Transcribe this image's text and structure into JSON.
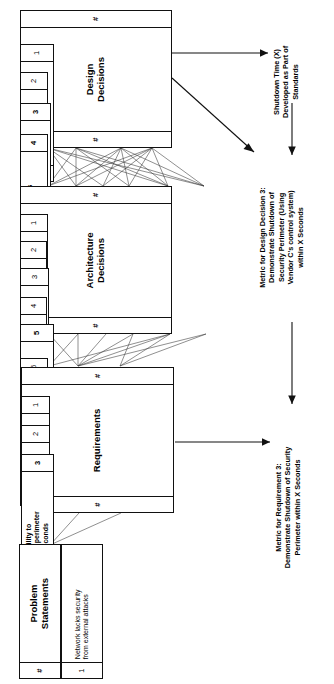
{
  "diagram": {
    "orientation": "rotated-90-ccw"
  },
  "tables": {
    "design_decisions": {
      "title": "Design\nDecisions",
      "num_header": "#",
      "rows": [
        {
          "num": "1",
          "text": "Vendor A IDS (Type,\nOS, Config) selected",
          "bold": false
        },
        {
          "num": "2",
          "text": "Vendor B routers\n(Type, OS, Config)\nSelected",
          "bold": false
        },
        {
          "num": "3",
          "text": "Vendor C's perimeter\ncontrol system\nselected",
          "bold": true
        },
        {
          "num": "4",
          "text": "Perimeter standards\n(List) selected",
          "bold": true
        }
      ]
    },
    "architecture_decisions": {
      "title": "Architecture\nDecisions",
      "num_header": "#",
      "rows": [
        {
          "num": "1",
          "text": "Collapse all external\nconnections to two\nlocations",
          "bold": false
        },
        {
          "num": "2",
          "text": "Provide DMZs to external\nnetworks",
          "bold": false
        },
        {
          "num": "3",
          "text": "Provide X class\ndistributed IDS and deep-\npacket inspection",
          "bold": false
        },
        {
          "num": "4",
          "text": "Provide X class border\nrouters at DMZs",
          "bold": false
        },
        {
          "num": "5",
          "text": "Develop standards for\nnetwork perimeter and\nsecurity components",
          "bold": true
        },
        {
          "num": "6",
          "text": "Provide centralized\ncontrol of DMZs",
          "bold": false
        }
      ]
    },
    "requirements": {
      "title": "Requirements",
      "num_header": "#",
      "rows": [
        {
          "num": "1",
          "text": "Provide defense-in-\ndepth network security",
          "bold": false
        },
        {
          "num": "2",
          "text": "Establish secure\nperimeter to external\nnetworks",
          "bold": false
        },
        {
          "num": "3",
          "text": "Provide ability to\nshut down perimeter\nwithin X seconds",
          "bold": true
        }
      ]
    },
    "problem_statements": {
      "title": "Problem\nStatements",
      "num_header": "#",
      "rows": [
        {
          "num": "1",
          "text": "Network lacks security\nfrom external attacks",
          "bold": false
        }
      ]
    }
  },
  "notes": {
    "shutdown_time": "Shutdown Time (X)\nDeveloped as Part of\nStandards",
    "metric_design_decision_3": "Metric for Design Decision 3:\nDemonstrate Shutdown of\nSecurity Perimeter (Using\nVendor C's control system)\nwithin X Seconds",
    "metric_requirement_3": "Metric for Requirement 3:\nDemonstrate Shutdown of Security\nPerimeter within X Seconds"
  },
  "colors": {
    "line": "#333333",
    "border": "#111111",
    "background": "#ffffff"
  }
}
